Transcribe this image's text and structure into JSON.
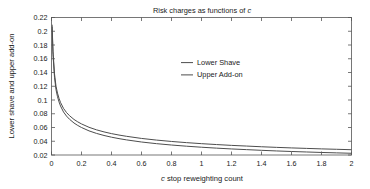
{
  "chart_data": {
    "type": "line",
    "title": "Risk charges as functions of c",
    "title_italic_token": "c",
    "xlabel": "c stop reweighting count",
    "xlabel_italic_token": "c",
    "ylabel": "Lower shave and upper add-on",
    "xlim": [
      0,
      2
    ],
    "ylim": [
      0.02,
      0.22
    ],
    "grid": false,
    "legend_position": "upper-center-right",
    "xticks": [
      0,
      0.2,
      0.4,
      0.6,
      0.8,
      1,
      1.2,
      1.4,
      1.6,
      1.8,
      2
    ],
    "xtick_labels": [
      "0",
      "0.2",
      "0.4",
      "0.6",
      "0.8",
      "1",
      "1.2",
      "1.4",
      "1.6",
      "1.8",
      "2"
    ],
    "yticks": [
      0.02,
      0.04,
      0.06,
      0.08,
      0.1,
      0.12,
      0.14,
      0.16,
      0.18,
      0.2,
      0.22
    ],
    "ytick_labels": [
      "0.02",
      "0.04",
      "0.06",
      "0.08",
      "0.1",
      "0.12",
      "0.14",
      "0.16",
      "0.18",
      "0.2",
      "0.22"
    ],
    "x": [
      0.004,
      0.01,
      0.02,
      0.03,
      0.04,
      0.05,
      0.06,
      0.08,
      0.1,
      0.12,
      0.15,
      0.175,
      0.2,
      0.25,
      0.3,
      0.35,
      0.4,
      0.45,
      0.5,
      0.6,
      0.7,
      0.8,
      0.9,
      1.0,
      1.1,
      1.2,
      1.3,
      1.4,
      1.5,
      1.6,
      1.7,
      1.8,
      1.9,
      2.0
    ],
    "series": [
      {
        "name": "Lower Shave",
        "color": "#4d4d4d",
        "values": [
          0.209,
          0.171,
          0.138,
          0.12,
          0.11,
          0.1025,
          0.0965,
          0.0878,
          0.0818,
          0.0772,
          0.0717,
          0.0682,
          0.0652,
          0.0603,
          0.0566,
          0.0536,
          0.0511,
          0.049,
          0.0472,
          0.0441,
          0.0417,
          0.0397,
          0.038,
          0.0365,
          0.0352,
          0.034,
          0.033,
          0.032,
          0.0311,
          0.0303,
          0.0296,
          0.0289,
          0.0283,
          0.0277
        ]
      },
      {
        "name": "Upper Add-on",
        "color": "#4d4d4d",
        "values": [
          0.206,
          0.166,
          0.133,
          0.115,
          0.1048,
          0.0973,
          0.0913,
          0.0826,
          0.0766,
          0.072,
          0.0665,
          0.063,
          0.06,
          0.0551,
          0.0514,
          0.0484,
          0.0459,
          0.0438,
          0.042,
          0.0389,
          0.0365,
          0.0345,
          0.0328,
          0.0313,
          0.03,
          0.0288,
          0.0278,
          0.0268,
          0.0259,
          0.0251,
          0.0244,
          0.0237,
          0.0231,
          0.0225
        ]
      }
    ]
  },
  "legend": {
    "items": [
      {
        "label": "Lower Shave"
      },
      {
        "label": "Upper Add-on"
      }
    ]
  },
  "colors": {
    "axis": "#555555",
    "text": "#1a1a1a",
    "series_lower": "#4d4d4d",
    "series_upper": "#4d4d4d",
    "background": "#ffffff"
  }
}
